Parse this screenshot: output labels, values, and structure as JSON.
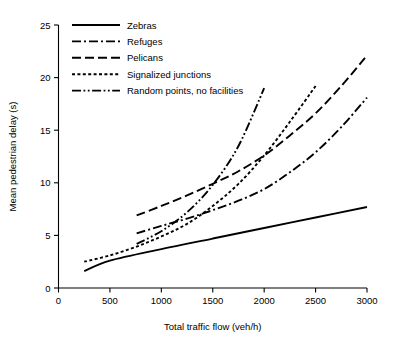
{
  "chart_data": {
    "type": "line",
    "title": "",
    "xlabel": "Total traffic flow (veh/h)",
    "ylabel": "Mean pedestrian delay (s)",
    "xlim": [
      0,
      3000
    ],
    "ylim": [
      0,
      25
    ],
    "xticks": [
      0,
      500,
      1000,
      1500,
      2000,
      2500,
      3000
    ],
    "xtick_labels": [
      "0",
      "500",
      "1000",
      "1500",
      "2000",
      "2500",
      "3000"
    ],
    "yticks": [
      0,
      5,
      10,
      15,
      20,
      25
    ],
    "ytick_labels": [
      "0",
      "5",
      "10",
      "15",
      "20",
      "25"
    ],
    "grid": false,
    "legend_position": "top-left",
    "frame": "left-bottom-spines",
    "series": [
      {
        "name": "Zebras",
        "dash_style": "solid",
        "dasharray": "",
        "x": [
          250,
          500,
          1000,
          1500,
          2000,
          2500,
          3000
        ],
        "y": [
          1.6,
          2.6,
          3.7,
          4.7,
          5.7,
          6.7,
          7.7
        ]
      },
      {
        "name": "Refuges",
        "dash_style": "dash-dot",
        "dasharray": "9,3,2,3",
        "x": [
          760,
          1000,
          1250,
          1500,
          1750,
          2000,
          2250,
          2500,
          2750,
          3000
        ],
        "y": [
          5.2,
          5.9,
          6.6,
          7.4,
          8.3,
          9.4,
          11.0,
          12.9,
          15.3,
          18.1
        ]
      },
      {
        "name": "Pelicans",
        "dash_style": "long-dash",
        "dasharray": "9,4",
        "x": [
          760,
          1000,
          1250,
          1500,
          1750,
          2000,
          2250,
          2500,
          2750,
          3000
        ],
        "y": [
          6.9,
          7.8,
          8.8,
          9.9,
          11.1,
          12.6,
          14.5,
          16.6,
          19.2,
          22.1
        ]
      },
      {
        "name": "Signalized junctions",
        "dash_style": "dotted",
        "dasharray": "3,2.4",
        "x": [
          250,
          500,
          750,
          1000,
          1250,
          1500,
          1750,
          2000,
          2250,
          2500
        ],
        "y": [
          2.5,
          3.1,
          3.9,
          4.9,
          6.1,
          7.8,
          9.9,
          12.6,
          15.8,
          19.2
        ]
      },
      {
        "name": "Random points, no facilities",
        "dash_style": "dash-dot-dot",
        "dasharray": "9,2.5,1.8,2.5,1.8,2.5",
        "x": [
          760,
          1000,
          1250,
          1500,
          1750,
          2000
        ],
        "y": [
          4.2,
          5.4,
          7.2,
          9.8,
          13.5,
          19.0
        ]
      }
    ]
  },
  "legend": {
    "entries": [
      {
        "label": "Zebras"
      },
      {
        "label": "Refuges"
      },
      {
        "label": "Pelicans"
      },
      {
        "label": "Signalized junctions"
      },
      {
        "label": "Random points, no facilities"
      }
    ]
  }
}
